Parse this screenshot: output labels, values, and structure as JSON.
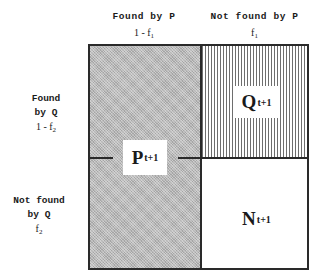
{
  "columns": [
    {
      "heading": "Found by P",
      "value_prefix": "1 - f",
      "value_sub": "1"
    },
    {
      "heading": "Not found by P",
      "value_prefix": "f",
      "value_sub": "1"
    }
  ],
  "rows": [
    {
      "heading_line1": "Found",
      "heading_line2": "by Q",
      "value_prefix": "1 - f",
      "value_sub": "2"
    },
    {
      "heading_line1": "Not found",
      "heading_line2": "by Q",
      "value_prefix": "f",
      "value_sub": "2"
    }
  ],
  "regions": {
    "p": {
      "letter": "P",
      "sub": "t+1",
      "fill": "stippled gray",
      "color": "#b8b8b8"
    },
    "q": {
      "letter": "Q",
      "sub": "t+1",
      "fill": "vertical stripes",
      "color": "#6e6e6e"
    },
    "n": {
      "letter": "N",
      "sub": "t+1",
      "fill": "white",
      "color": "#ffffff"
    }
  }
}
